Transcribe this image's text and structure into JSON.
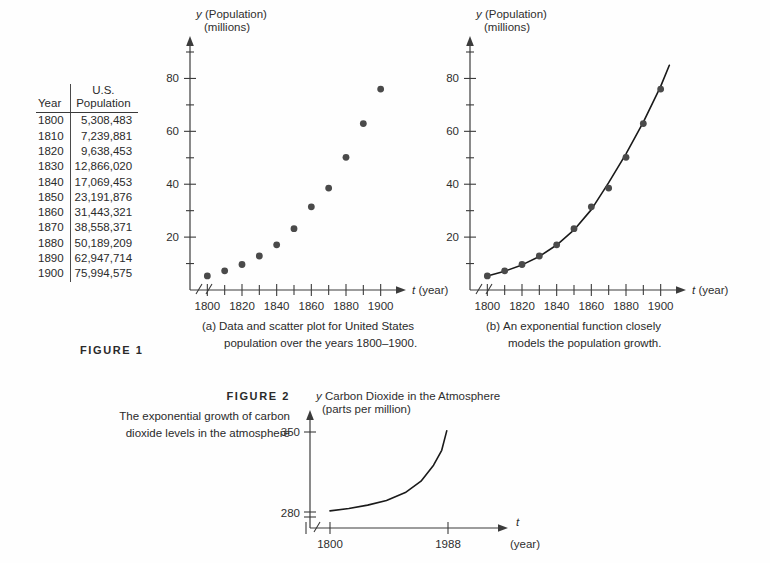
{
  "table": {
    "headers": {
      "year": "Year",
      "population_line1": "U.S.",
      "population_line2": "Population"
    },
    "rows": [
      {
        "year": "1800",
        "population": "5,308,483"
      },
      {
        "year": "1810",
        "population": "7,239,881"
      },
      {
        "year": "1820",
        "population": "9,638,453"
      },
      {
        "year": "1830",
        "population": "12,866,020"
      },
      {
        "year": "1840",
        "population": "17,069,453"
      },
      {
        "year": "1850",
        "population": "23,191,876"
      },
      {
        "year": "1860",
        "population": "31,443,321"
      },
      {
        "year": "1870",
        "population": "38,558,371"
      },
      {
        "year": "1880",
        "population": "50,189,209"
      },
      {
        "year": "1890",
        "population": "62,947,714"
      },
      {
        "year": "1900",
        "population": "75,994,575"
      }
    ]
  },
  "figure1": {
    "label": "FIGURE 1",
    "panel_a": {
      "caption_marker": "(a)",
      "caption_line1": "Data and scatter plot for United States",
      "caption_line2": "population over the years 1800–1900."
    },
    "panel_b": {
      "caption_marker": "(b)",
      "caption_line1": "An exponential function closely",
      "caption_line2": "models the population growth."
    },
    "axes": {
      "y_name": "y",
      "y_unit_line1": "(Population)",
      "y_unit_line2": "(millions)",
      "x_name": "t",
      "x_unit": "(year)",
      "y_ticks_labeled": [
        "20",
        "40",
        "60",
        "80"
      ],
      "x_ticks_labeled": [
        "1800",
        "1820",
        "1840",
        "1860",
        "1880",
        "1900"
      ]
    }
  },
  "figure2": {
    "label": "FIGURE 2",
    "caption_line1": "The exponential growth of carbon",
    "caption_line2": "dioxide levels in the atmosphere",
    "axes": {
      "y_name": "y",
      "y_title": "Carbon Dioxide in the Atmosphere",
      "y_unit": "(parts per million)",
      "x_name": "t",
      "x_unit": "(year)",
      "y_ticks_labeled": [
        "280",
        "350"
      ],
      "x_ticks_labeled": [
        "1800",
        "1988"
      ]
    }
  },
  "chart_data": [
    {
      "type": "scatter",
      "id": "figure1-panel-a",
      "title": "Data and scatter plot for United States population over the years 1800-1900.",
      "xlabel": "t (year)",
      "ylabel": "y (Population) (millions)",
      "xlim": [
        1790,
        1910
      ],
      "ylim": [
        0,
        90
      ],
      "x_tick_step": 10,
      "x_labeled_step": 20,
      "y_tick_step": 10,
      "y_labeled_step": 20,
      "grid": false,
      "legend": "none",
      "axis_break_x": true,
      "x": [
        1800,
        1810,
        1820,
        1830,
        1840,
        1850,
        1860,
        1870,
        1880,
        1890,
        1900
      ],
      "y": [
        5.308483,
        7.239881,
        9.638453,
        12.86602,
        17.069453,
        23.191876,
        31.443321,
        38.558371,
        50.189209,
        62.947714,
        75.994575
      ]
    },
    {
      "type": "scatter",
      "id": "figure1-panel-b",
      "title": "An exponential function closely models the population growth.",
      "xlabel": "t (year)",
      "ylabel": "y (Population) (millions)",
      "xlim": [
        1790,
        1910
      ],
      "ylim": [
        0,
        90
      ],
      "x_tick_step": 10,
      "x_labeled_step": 20,
      "y_tick_step": 10,
      "y_labeled_step": 20,
      "grid": false,
      "legend": "none",
      "axis_break_x": true,
      "x": [
        1800,
        1810,
        1820,
        1830,
        1840,
        1850,
        1860,
        1870,
        1880,
        1890,
        1900
      ],
      "y": [
        5.308483,
        7.239881,
        9.638453,
        12.86602,
        17.069453,
        23.191876,
        31.443321,
        38.558371,
        50.189209,
        62.947714,
        75.994575
      ],
      "series": [
        {
          "name": "exponential fit",
          "type": "line",
          "note": "smooth exponential curve fitted through the data, extended slightly past 1900",
          "x": [
            1800,
            1810,
            1820,
            1830,
            1840,
            1850,
            1860,
            1870,
            1880,
            1890,
            1900,
            1905
          ],
          "y": [
            5.3,
            7.1,
            9.5,
            12.7,
            17.0,
            22.7,
            30.4,
            40.6,
            51.5,
            63.5,
            77.0,
            85.0
          ]
        }
      ]
    },
    {
      "type": "line",
      "id": "figure2",
      "title": "Carbon Dioxide in the Atmosphere (parts per million)",
      "xlabel": "t (year)",
      "ylabel": "y Carbon Dioxide in the Atmosphere (parts per million)",
      "xlim": [
        1800,
        1988
      ],
      "ylim": [
        280,
        350
      ],
      "y_ticks": [
        280,
        350
      ],
      "x_ticks": [
        1800,
        1988
      ],
      "grid": false,
      "legend": "none",
      "axis_break_x": true,
      "axis_break_y": true,
      "x": [
        1800,
        1830,
        1860,
        1890,
        1920,
        1945,
        1965,
        1978,
        1986
      ],
      "y": [
        281,
        283,
        286,
        290,
        297,
        307,
        321,
        334,
        351
      ]
    }
  ]
}
